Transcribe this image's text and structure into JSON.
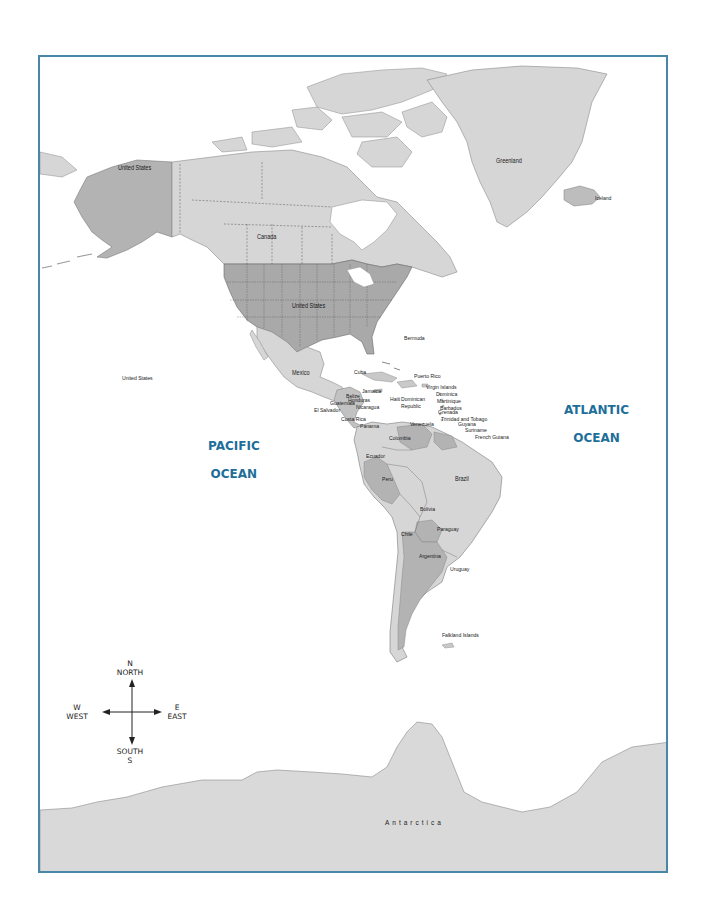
{
  "map": {
    "title": "",
    "frame_color": "#4a86a8",
    "colors": {
      "land_light": "#d9d9d9",
      "land_mid": "#c4c4c4",
      "land_dark": "#a9a9a9",
      "water": "#ffffff",
      "ocean_label": "#1e6e9a",
      "border_dash": "#555555"
    }
  },
  "oceans": {
    "pacific": {
      "line1": "PACIFIC",
      "line2": "OCEAN"
    },
    "atlantic": {
      "line1": "ATLANTIC",
      "line2": "OCEAN"
    }
  },
  "labels": {
    "alaska": "United States",
    "canada": "Canada",
    "us_mainland": "United States",
    "hawaii": "United States",
    "greenland": "Greenland",
    "iceland": "Iceland",
    "bermuda": "Bermuda",
    "mexico": "Mexico",
    "cuba": "Cuba",
    "jamaica": "Jamaica",
    "haiti": "Haiti",
    "dominican_republic": "Dominican Republic",
    "puerto_rico": "Puerto Rico",
    "virgin_islands": "Virgin Islands",
    "dominica": "Dominica",
    "martinique": "Martinique",
    "barbados": "Barbados",
    "grenada": "Grenada",
    "trinidad_tobago": "Trinidad and Tobago",
    "belize": "Belize",
    "guatemala": "Guatemala",
    "honduras": "Honduras",
    "el_salvador": "El Salvador",
    "nicaragua": "Nicaragua",
    "costa_rica": "Costa Rica",
    "panama": "Panama",
    "venezuela": "Venezuela",
    "colombia": "Colombia",
    "guyana": "Guyana",
    "suriname": "Suriname",
    "french_guiana": "French Guiana",
    "ecuador": "Ecuador",
    "peru": "Peru",
    "brazil": "Brazil",
    "bolivia": "Bolivia",
    "paraguay": "Paraguay",
    "chile": "Chile",
    "argentina": "Argentina",
    "uruguay": "Uruguay",
    "falkland_islands": "Falkland Islands",
    "antarctica": "Antarctica"
  },
  "compass": {
    "n_letter": "N",
    "n_word": "NORTH",
    "w_letter": "W",
    "w_word": "WEST",
    "e_letter": "E",
    "e_word": "EAST",
    "s_word": "SOUTH",
    "s_letter": "S"
  }
}
